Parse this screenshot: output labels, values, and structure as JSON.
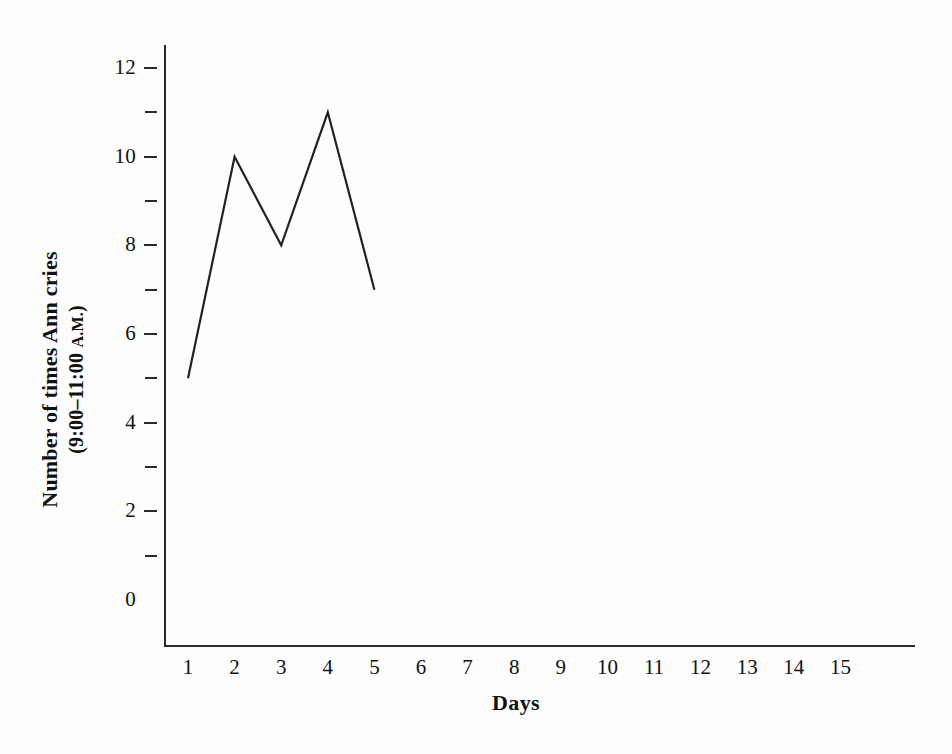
{
  "chart_data": {
    "type": "line",
    "title": "",
    "subtitle": "",
    "xlabel": "Days",
    "ylabel_line1": "Number of times Ann cries",
    "ylabel_line2_prefix": "(9:00–11:00 ",
    "ylabel_line2_smallcaps": "A.M.",
    "ylabel_line2_suffix": ")",
    "ylabel_full": "Number of times Ann cries (9:00–11:00 A.M.)",
    "x": [
      1,
      2,
      3,
      4,
      5
    ],
    "values": [
      5,
      10,
      8,
      11,
      7
    ],
    "series": [
      {
        "name": "Number of times Ann cries",
        "values": [
          5,
          10,
          8,
          11,
          7
        ]
      }
    ],
    "xlim": [
      1,
      15
    ],
    "ylim": [
      0,
      12
    ],
    "x_tick_labels": [
      "1",
      "2",
      "3",
      "4",
      "5",
      "6",
      "7",
      "8",
      "9",
      "10",
      "11",
      "12",
      "13",
      "14",
      "15"
    ],
    "y_tick_labels_major": [
      "0",
      "2",
      "4",
      "6",
      "8",
      "10",
      "12"
    ],
    "y_major_ticks": [
      2,
      4,
      6,
      8,
      10,
      12
    ],
    "y_minor_ticks": [
      1,
      3,
      5,
      7,
      9,
      11
    ],
    "y_zero_has_tick": false,
    "x_has_ticks": false,
    "grid": false,
    "legend": false,
    "line_color": "#222222",
    "axis_color": "#2a2a2a",
    "background_color": "#fdfdfd",
    "markers": false
  },
  "axis_labels": {
    "y": [
      {
        "value": 12,
        "text": "12",
        "major": true
      },
      {
        "value": 11,
        "text": "",
        "major": false
      },
      {
        "value": 10,
        "text": "10",
        "major": true
      },
      {
        "value": 9,
        "text": "",
        "major": false
      },
      {
        "value": 8,
        "text": "8",
        "major": true
      },
      {
        "value": 7,
        "text": "",
        "major": false
      },
      {
        "value": 6,
        "text": "6",
        "major": true
      },
      {
        "value": 5,
        "text": "",
        "major": false
      },
      {
        "value": 4,
        "text": "4",
        "major": true
      },
      {
        "value": 3,
        "text": "",
        "major": false
      },
      {
        "value": 2,
        "text": "2",
        "major": true
      },
      {
        "value": 1,
        "text": "",
        "major": false
      },
      {
        "value": 0,
        "text": "0",
        "major": true
      }
    ],
    "x": [
      {
        "value": 1,
        "text": "1"
      },
      {
        "value": 2,
        "text": "2"
      },
      {
        "value": 3,
        "text": "3"
      },
      {
        "value": 4,
        "text": "4"
      },
      {
        "value": 5,
        "text": "5"
      },
      {
        "value": 6,
        "text": "6"
      },
      {
        "value": 7,
        "text": "7"
      },
      {
        "value": 8,
        "text": "8"
      },
      {
        "value": 9,
        "text": "9"
      },
      {
        "value": 10,
        "text": "10"
      },
      {
        "value": 11,
        "text": "11"
      },
      {
        "value": 12,
        "text": "12"
      },
      {
        "value": 13,
        "text": "13"
      },
      {
        "value": 14,
        "text": "14"
      },
      {
        "value": 15,
        "text": "15"
      }
    ]
  }
}
